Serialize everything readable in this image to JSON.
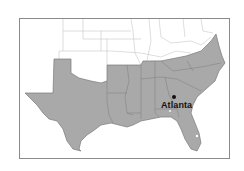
{
  "map": {
    "title": "",
    "region_description": "Southeastern United States with Confederate states shaded",
    "colors": {
      "shaded_fill": "#a9a9a9",
      "unshaded_fill": "#ffffff",
      "state_border": "#7a7a7a",
      "light_border": "#c8c8c8",
      "frame_border": "#8a8a8a"
    },
    "cities": [
      {
        "name": "Atlanta",
        "marker": "dot"
      }
    ]
  }
}
